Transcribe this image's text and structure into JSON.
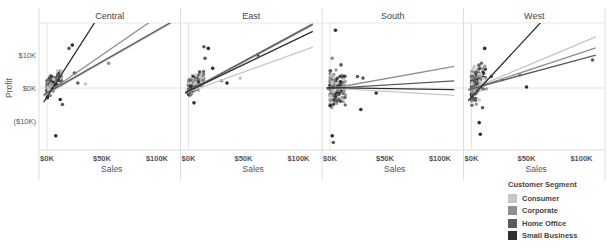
{
  "chart_data": {
    "type": "scatter",
    "title": "",
    "xlabel": "Sales",
    "ylabel": "Profit",
    "facet_by": "Region",
    "panels": [
      "Central",
      "East",
      "South",
      "West"
    ],
    "x_ticks": [
      "$0K",
      "$50K",
      "$100K"
    ],
    "y_ticks": [
      "$10K",
      "$0K",
      "($10K)"
    ],
    "xlim": [
      -3000,
      113000
    ],
    "ylim": [
      -19000,
      20000
    ],
    "grid": false,
    "trend_lines": true,
    "legend": {
      "title": "Customer Segment",
      "position": "bottom-right",
      "entries": [
        {
          "name": "Consumer",
          "color": "#c7c7c7"
        },
        {
          "name": "Corporate",
          "color": "#8f8f8f"
        },
        {
          "name": "Home Office",
          "color": "#5b5b5b"
        },
        {
          "name": "Small Business",
          "color": "#2f2f2f"
        }
      ]
    },
    "series": [
      {
        "panel": "Central",
        "trends": [
          {
            "segment": "Consumer",
            "slope": 0.19,
            "intercept": -1800
          },
          {
            "segment": "Corporate",
            "slope": 0.23,
            "intercept": -1500
          },
          {
            "segment": "Home Office",
            "slope": 0.19,
            "intercept": -1500
          },
          {
            "segment": "Small Business",
            "slope": 0.52,
            "intercept": -2700
          }
        ],
        "outliers": [
          [
            8000,
            -14500,
            3
          ],
          [
            23000,
            13000,
            3
          ],
          [
            20000,
            12000,
            2
          ],
          [
            56000,
            7500,
            1
          ],
          [
            28000,
            1500,
            2
          ],
          [
            35000,
            1200,
            0
          ],
          [
            25000,
            4500,
            2
          ],
          [
            12000,
            -3500,
            3
          ],
          [
            14000,
            -5000,
            2
          ]
        ]
      },
      {
        "panel": "East",
        "trends": [
          {
            "segment": "Consumer",
            "slope": 0.12,
            "intercept": -1200
          },
          {
            "segment": "Corporate",
            "slope": 0.18,
            "intercept": -1200
          },
          {
            "segment": "Home Office",
            "slope": 0.18,
            "intercept": -900
          },
          {
            "segment": "Small Business",
            "slope": 0.16,
            "intercept": -900
          }
        ],
        "outliers": [
          [
            63000,
            10000,
            3
          ],
          [
            47000,
            3000,
            0
          ],
          [
            35000,
            1500,
            3
          ],
          [
            30000,
            2200,
            1
          ],
          [
            18000,
            12000,
            3
          ],
          [
            14000,
            12500,
            2
          ],
          [
            5000,
            -4500,
            3
          ],
          [
            22000,
            6000,
            3
          ],
          [
            15000,
            9000,
            2
          ]
        ]
      },
      {
        "panel": "South",
        "trends": [
          {
            "segment": "Consumer",
            "slope": -0.02,
            "intercept": 0
          },
          {
            "segment": "Corporate",
            "slope": 0.06,
            "intercept": -200
          },
          {
            "segment": "Home Office",
            "slope": 0.02,
            "intercept": -100
          },
          {
            "segment": "Small Business",
            "slope": -0.005,
            "intercept": 100
          }
        ],
        "outliers": [
          [
            5000,
            17500,
            3
          ],
          [
            2000,
            -14500,
            3
          ],
          [
            3000,
            -16500,
            2
          ],
          [
            42000,
            -1500,
            3
          ],
          [
            28000,
            -6500,
            3
          ],
          [
            25000,
            3500,
            2
          ],
          [
            30000,
            3000,
            2
          ],
          [
            10000,
            7000,
            2
          ],
          [
            2000,
            9000,
            1
          ]
        ]
      },
      {
        "panel": "West",
        "trends": [
          {
            "segment": "Consumer",
            "slope": 0.14,
            "intercept": -300
          },
          {
            "segment": "Corporate",
            "slope": 0.11,
            "intercept": -300
          },
          {
            "segment": "Home Office",
            "slope": 0.09,
            "intercept": -200
          },
          {
            "segment": "Small Business",
            "slope": 0.36,
            "intercept": -2800
          }
        ],
        "outliers": [
          [
            110000,
            8500,
            2
          ],
          [
            50000,
            300,
            3
          ],
          [
            44000,
            4000,
            1
          ],
          [
            8000,
            -14000,
            3
          ],
          [
            7000,
            -10500,
            3
          ],
          [
            12000,
            12000,
            3
          ],
          [
            18000,
            3500,
            2
          ],
          [
            28000,
            2500,
            1
          ],
          [
            10000,
            -6000,
            2
          ]
        ]
      }
    ]
  },
  "axes": {
    "y_title": "Profit",
    "x_title": "Sales"
  },
  "legend": {
    "title": "Customer Segment",
    "items": [
      "Consumer",
      "Corporate",
      "Home Office",
      "Small Business"
    ]
  }
}
